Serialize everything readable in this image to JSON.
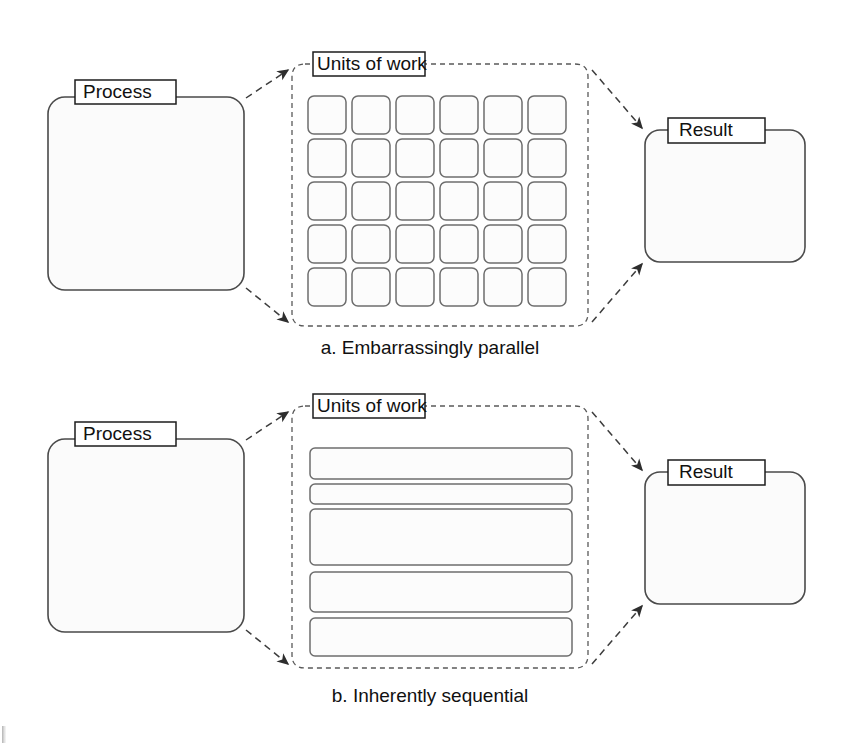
{
  "figure": {
    "kind": "two-panel schematic diagram",
    "background_color": "#ffffff",
    "line_color": "#3d3d3d",
    "fill_color": "#fbfbfb"
  },
  "panels": [
    {
      "id": "panel-a",
      "caption": "a. Embarrassingly parallel",
      "process": {
        "label": "Process"
      },
      "units": {
        "label": "Units of work"
      },
      "result": {
        "label": "Result"
      },
      "work_layout": {
        "type": "grid",
        "columns": 6,
        "rows": 5,
        "total_units": 30
      }
    },
    {
      "id": "panel-b",
      "caption": "b. Inherently sequential",
      "process": {
        "label": "Process"
      },
      "units": {
        "label": "Units of work"
      },
      "result": {
        "label": "Result"
      },
      "work_layout": {
        "type": "stacked-bars",
        "bars": 5,
        "bar_heights": [
          31,
          20,
          56,
          40,
          38
        ]
      }
    }
  ],
  "connectors": {
    "process_to_units_top": "dashed arrow",
    "process_to_units_bottom": "dashed arrow",
    "units_to_result_top": "dashed arrow",
    "units_to_result_bottom": "dashed arrow"
  }
}
